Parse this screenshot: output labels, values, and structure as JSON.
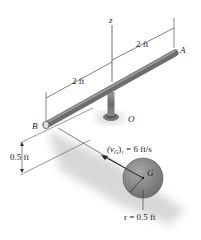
{
  "diagram": {
    "axis": {
      "z_label": "z"
    },
    "points": {
      "A": "A",
      "B": "B",
      "O": "O",
      "G": "G"
    },
    "dimensions": {
      "OA_length": "2 ft",
      "OB_length": "2 ft",
      "height": "0.5 ft",
      "radius": "r = 0.5 ft"
    },
    "velocity": {
      "label_main": "(v",
      "label_sub": "G",
      "label_close": ")",
      "label_index": "1",
      "label_value": " = 6 ft/s"
    },
    "colors": {
      "rod": "#7a7a7a",
      "sphere": "#8e8e8e",
      "shadow": "#d0d0d0",
      "line": "#333333"
    }
  }
}
